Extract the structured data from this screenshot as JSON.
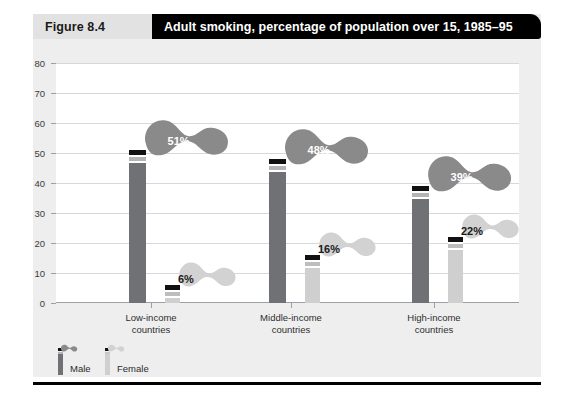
{
  "header": {
    "figure_label": "Figure 8.4",
    "title": "Adult smoking, percentage of population over 15, 1985–95"
  },
  "colors": {
    "male_body": "#6f7174",
    "male_band": "#b4b4b4",
    "female_body": "#cfcfcf",
    "female_band": "#bdbdbd",
    "tip": "#111111",
    "male_smoke": "#8a8a8a",
    "female_smoke": "#d2d2d2",
    "panel_bg": "#eeeeee",
    "plot_bg": "#ffffff",
    "gridline": "#d5d8dc",
    "header_band": "#e2e2e2",
    "header_title_bg": "#000000"
  },
  "legend": {
    "items": [
      {
        "label": "Male",
        "key": "male"
      },
      {
        "label": "Female",
        "key": "female"
      }
    ]
  },
  "chart_data": {
    "type": "bar",
    "title": "Adult smoking, percentage of population over 15, 1985–95",
    "xlabel": "",
    "ylabel": "",
    "ylim": [
      0,
      80
    ],
    "yticks": [
      0,
      10,
      20,
      30,
      40,
      50,
      60,
      70,
      80
    ],
    "ytick_labels": [
      "0",
      "10",
      "20",
      "30",
      "40",
      "50",
      "60",
      "70",
      "80"
    ],
    "grid": true,
    "legend_position": "bottom-left",
    "categories": [
      "Low-income\ncountries",
      "Middle-income\ncountries",
      "High-income\ncountries"
    ],
    "category_lines": [
      [
        "Low-income",
        "countries"
      ],
      [
        "Middle-income",
        "countries"
      ],
      [
        "High-income",
        "countries"
      ]
    ],
    "series": [
      {
        "name": "Male",
        "values": [
          51,
          48,
          39
        ],
        "labels": [
          "51%",
          "48%",
          "39%"
        ]
      },
      {
        "name": "Female",
        "values": [
          6,
          16,
          22
        ],
        "labels": [
          "6%",
          "16%",
          "22%"
        ]
      }
    ]
  }
}
